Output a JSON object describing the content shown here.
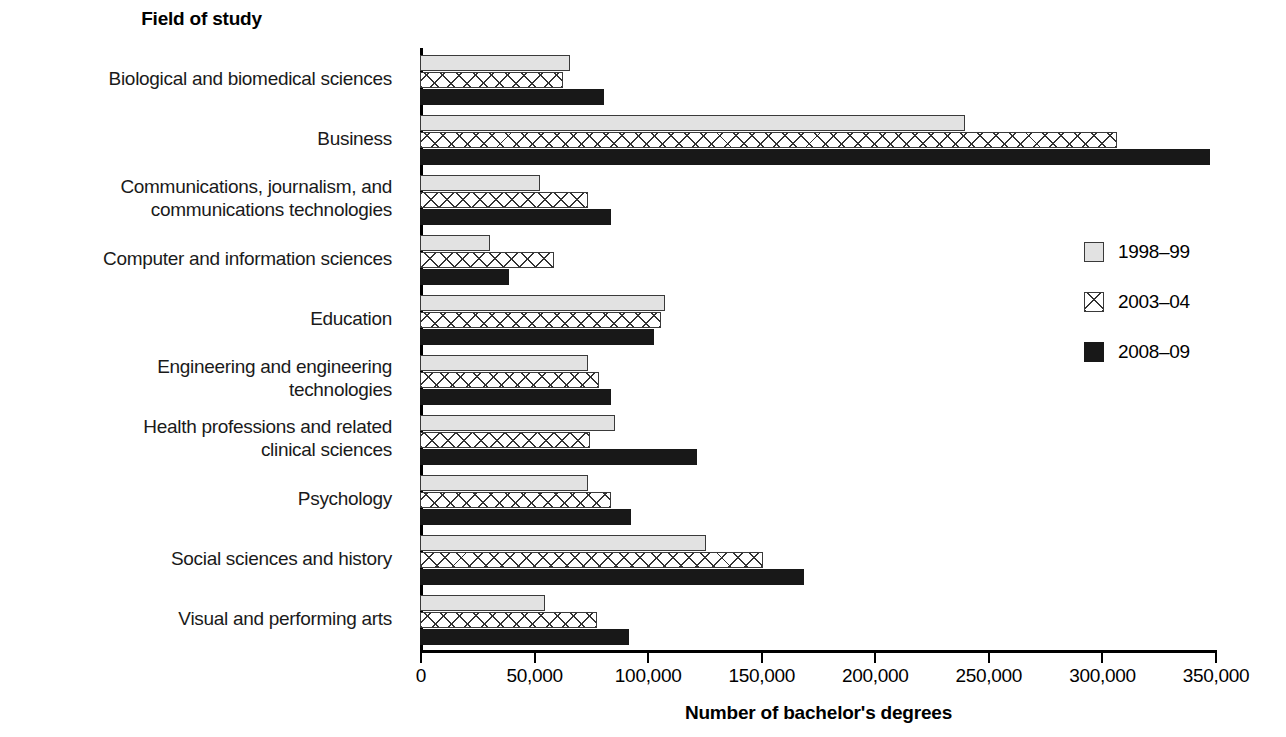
{
  "chart_data": {
    "type": "bar",
    "orientation": "horizontal",
    "title": "Field of study",
    "xlabel": "Number of bachelor's degrees",
    "ylabel": "Field of study",
    "xlim": [
      0,
      350000
    ],
    "xticks": [
      0,
      50000,
      100000,
      150000,
      200000,
      250000,
      300000,
      350000
    ],
    "xtick_labels": [
      "0",
      "50,000",
      "100,000",
      "150,000",
      "200,000",
      "250,000",
      "300,000",
      "350,000"
    ],
    "grid": false,
    "legend_position": "right",
    "categories": [
      "Biological and biomedical sciences",
      "Business",
      "Communications, journalism, and communications technologies",
      "Computer and information sciences",
      "Education",
      "Engineering and engineering technologies",
      "Health professions and related clinical sciences",
      "Psychology",
      "Social sciences and history",
      "Visual and performing arts"
    ],
    "series": [
      {
        "name": "1998–99",
        "fill": "light-gray",
        "values": [
          66000,
          240000,
          53000,
          31000,
          108000,
          74000,
          86000,
          74000,
          126000,
          55000
        ]
      },
      {
        "name": "2003–04",
        "fill": "crosshatch",
        "values": [
          63000,
          307000,
          74000,
          59000,
          106000,
          79000,
          75000,
          84000,
          151000,
          78000
        ]
      },
      {
        "name": "2008–09",
        "fill": "solid-black",
        "values": [
          81000,
          348000,
          84000,
          39000,
          103000,
          84000,
          122000,
          93000,
          169000,
          92000
        ]
      }
    ]
  },
  "category_label_lines": [
    [
      "Biological and biomedical sciences"
    ],
    [
      "Business"
    ],
    [
      "Communications, journalism, and",
      "communications technologies"
    ],
    [
      "Computer and information sciences"
    ],
    [
      "Education"
    ],
    [
      "Engineering and engineering",
      "technologies"
    ],
    [
      "Health professions and related",
      "clinical sciences"
    ],
    [
      "Psychology"
    ],
    [
      "Social sciences and history"
    ],
    [
      "Visual and performing arts"
    ]
  ],
  "colors": {
    "series_1998_99": "#e2e2e2",
    "series_2003_04": "#ffffff",
    "series_2008_09": "#181818",
    "outline": "#3a3a3a",
    "axis": "#000000",
    "text": "#000000",
    "background": "#ffffff"
  }
}
